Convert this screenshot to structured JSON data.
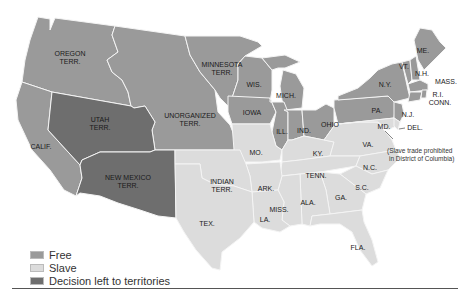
{
  "colors": {
    "free": "#9a9a9a",
    "slave": "#dcdcdc",
    "decision": "#6e6e6e"
  },
  "legend": [
    {
      "key": "free",
      "label": "Free"
    },
    {
      "key": "slave",
      "label": "Slave"
    },
    {
      "key": "decision",
      "label": "Decision left to territories"
    }
  ],
  "regions": {
    "free": [
      "OREGON TERR.",
      "MINNESOTA TERR.",
      "UNORGANIZED TERR.",
      "CALIF.",
      "WIS.",
      "MICH.",
      "IOWA",
      "ILL.",
      "IND.",
      "OHIO",
      "PA.",
      "N.Y.",
      "VT.",
      "N.H.",
      "ME.",
      "MASS.",
      "R.I.",
      "CONN.",
      "N.J."
    ],
    "slave": [
      "MO.",
      "KY.",
      "VA.",
      "MD.",
      "DEL.",
      "INDIAN TERR.",
      "ARK.",
      "TENN.",
      "N.C.",
      "S.C.",
      "GA.",
      "ALA.",
      "MISS.",
      "LA.",
      "TEX.",
      "FLA."
    ],
    "decision": [
      "UTAH TERR.",
      "NEW MEXICO TERR."
    ]
  },
  "labels": {
    "oregon": [
      "OREGON",
      "TERR."
    ],
    "minnesota": [
      "MINNESOTA",
      "TERR."
    ],
    "unorganized": [
      "UNORGANIZED",
      "TERR."
    ],
    "utah": [
      "UTAH",
      "TERR."
    ],
    "calif": "CALIF.",
    "newmexico": [
      "NEW MEXICO",
      "TERR."
    ],
    "indian": [
      "INDIAN",
      "TERR."
    ],
    "tex": "TEX.",
    "wis": "WIS.",
    "mich": "MICH.",
    "iowa": "IOWA",
    "ill": "ILL.",
    "ind": "IND.",
    "ohio": "OHIO",
    "pa": "PA.",
    "ny": "N.Y.",
    "vt": "VT.",
    "nh": "N.H.",
    "me": "ME.",
    "mass": "MASS.",
    "ri": "R.I.",
    "conn": "CONN.",
    "nj": "N.J.",
    "md": "MD.",
    "del": "DEL.",
    "va": "VA.",
    "mo": "MO.",
    "ky": "KY.",
    "tenn": "TENN.",
    "nc": "N.C.",
    "sc": "S.C.",
    "ga": "GA.",
    "ala": "ALA.",
    "miss": "MISS.",
    "ark": "ARK.",
    "la": "LA.",
    "fla": "FLA."
  },
  "annotation": [
    "(Slave trade prohibited",
    "in District of Columbia)"
  ]
}
